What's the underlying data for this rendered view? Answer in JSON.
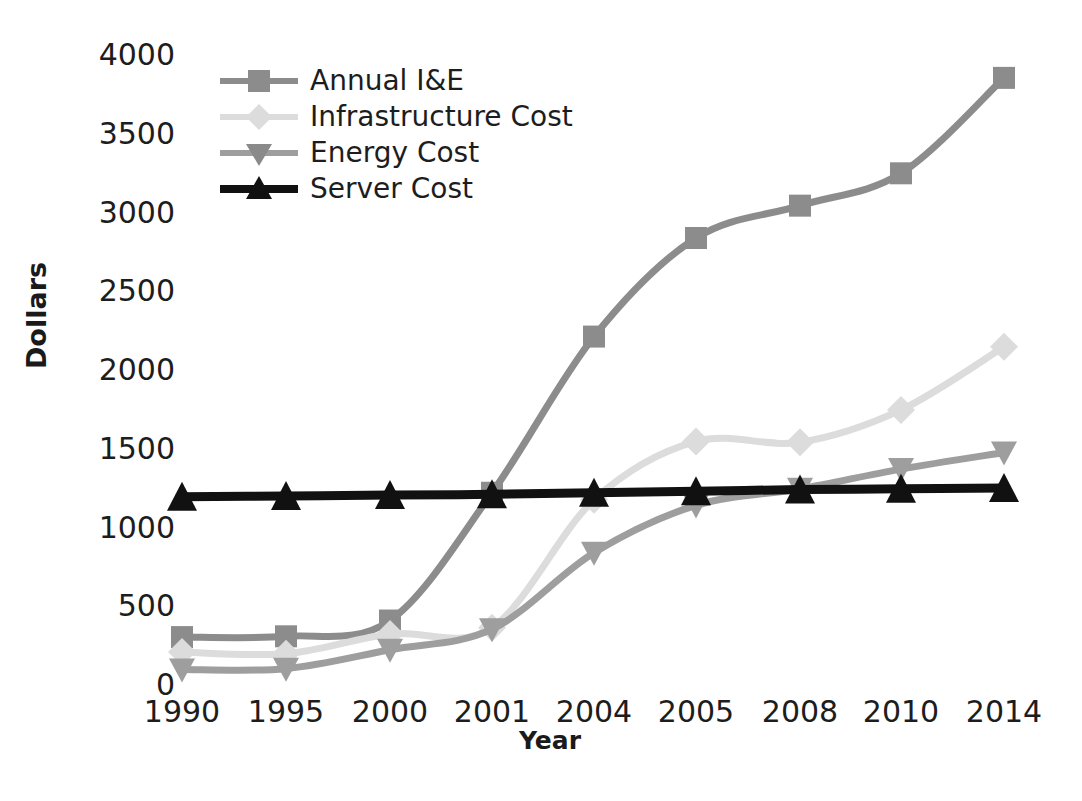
{
  "chart_data": {
    "type": "line",
    "title": "",
    "xlabel": "Year",
    "ylabel": "Dollars",
    "categories": [
      "1990",
      "1995",
      "2000",
      "2001",
      "2004",
      "2005",
      "2008",
      "2010",
      "2014"
    ],
    "ylim": [
      0,
      4000
    ],
    "yticks": [
      0,
      500,
      1000,
      1500,
      2000,
      2500,
      3000,
      3500,
      4000
    ],
    "ytick_labels": [
      "0",
      "500",
      "1000",
      "1500",
      "2000",
      "2500",
      "3000",
      "3500",
      "4000"
    ],
    "grid": false,
    "legend_position": "upper left",
    "series": [
      {
        "name": "Annual I&E",
        "marker": "square",
        "color": "#8c8c8c",
        "values": [
          310,
          315,
          415,
          1225,
          2215,
          2840,
          3045,
          3250,
          3855
        ]
      },
      {
        "name": "Infrastructure Cost",
        "marker": "diamond",
        "color": "#dcdcdc",
        "values": [
          215,
          205,
          330,
          370,
          1180,
          1550,
          1545,
          1750,
          2150
        ]
      },
      {
        "name": "Energy Cost",
        "marker": "triangle-down",
        "color": "#9e9e9e",
        "values": [
          105,
          110,
          230,
          360,
          845,
          1145,
          1250,
          1375,
          1480
        ]
      },
      {
        "name": "Server Cost",
        "marker": "triangle-up",
        "color": "#111111",
        "values": [
          1200,
          1205,
          1210,
          1215,
          1225,
          1235,
          1245,
          1250,
          1255
        ]
      }
    ]
  },
  "colors": {
    "annual_ie": "#8c8c8c",
    "infrastructure": "#dcdcdc",
    "energy": "#9e9e9e",
    "server": "#111111",
    "text": "#1d1d1d",
    "background": "#ffffff"
  }
}
